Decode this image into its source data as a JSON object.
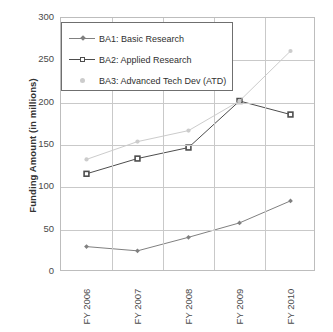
{
  "chart_data": {
    "type": "line",
    "title": "",
    "xlabel": "",
    "ylabel": "Funding Amount (in millions)",
    "categories": [
      "FY 2006",
      "FY 2007",
      "FY 2008",
      "FY 2009",
      "FY 2010"
    ],
    "ylim": [
      0,
      300
    ],
    "yticks": [
      0,
      50,
      100,
      150,
      200,
      250,
      300
    ],
    "ytick_labels": [
      "0",
      "50",
      "100",
      "150",
      "200",
      "250",
      "300"
    ],
    "grid": "horizontal-and-vertical",
    "legend_position": "inside-top-left",
    "series": [
      {
        "name": "BA1: Basic Research",
        "values": [
          30,
          25,
          41,
          58,
          84
        ],
        "color": "#808080",
        "marker": "diamond"
      },
      {
        "name": "BA2: Applied Research",
        "values": [
          116,
          134,
          147,
          202,
          186
        ],
        "color": "#4d4d4d",
        "marker": "square"
      },
      {
        "name": "BA3: Advanced Tech Dev (ATD)",
        "values": [
          133,
          154,
          167,
          202,
          261
        ],
        "color": "#cccccc",
        "marker": "circle"
      }
    ]
  },
  "axis": {
    "y_title": "Funding Amount (in millions)"
  },
  "legend": {
    "items": [
      {
        "label": "BA1: Basic Research"
      },
      {
        "label": "BA2: Applied Research"
      },
      {
        "label": "BA3: Advanced Tech Dev (ATD)"
      }
    ]
  }
}
